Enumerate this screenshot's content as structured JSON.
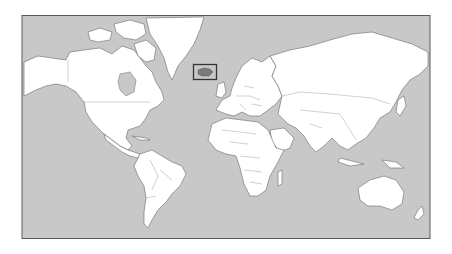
{
  "map": {
    "type": "world-political-outline",
    "projection": "mercator",
    "colors": {
      "ocean": "#c8c8c8",
      "land": "#ffffff",
      "borders": "#6a6a6a",
      "highlight_fill": "#7a7a7a",
      "highlight_box": "#333333"
    },
    "highlighted_region": {
      "name": "Iceland",
      "box": {
        "x": 193,
        "y": 64,
        "w": 24,
        "h": 16
      }
    },
    "frame": {
      "x": 22,
      "y": 15,
      "w": 408,
      "h": 224
    }
  }
}
